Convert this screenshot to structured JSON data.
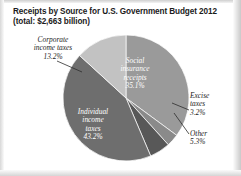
{
  "figure": {
    "title_line1": "Receipts by Source for U.S. Government Budget 2012",
    "title_line2": "(total: $2,663 billion)"
  },
  "chart_data": {
    "type": "pie",
    "title": "Receipts by Source for U.S. Government Budget 2012 (total: $2,663 billion)",
    "total_label": "(total: $2,663 billion)",
    "total_value": 2663,
    "total_units": "billion dollars",
    "value_units": "percent",
    "categories": [
      "Individual income taxes",
      "Social insurance receipts",
      "Corporate income taxes",
      "Other",
      "Excise taxes"
    ],
    "values": [
      43.2,
      35.1,
      13.2,
      5.3,
      3.2
    ],
    "slices": [
      {
        "label": "Individual income taxes",
        "label_line1": "Individual",
        "label_line2": "income",
        "label_line3": "taxes",
        "percent": "43.2%",
        "value": 43.2,
        "color": "#6e6e6e",
        "label_placement": "inside"
      },
      {
        "label": "Social insurance receipts",
        "label_line1": "Social",
        "label_line2": "insurance",
        "label_line3": "receipts",
        "percent": "35.1%",
        "value": 35.1,
        "color": "#9a9a9a",
        "label_placement": "inside"
      },
      {
        "label": "Corporate income taxes",
        "label_line1": "Corporate",
        "label_line2": "income taxes",
        "label_line3": "",
        "percent": "13.2%",
        "value": 13.2,
        "color": "#c2c2c2",
        "label_placement": "outside"
      },
      {
        "label": "Other",
        "label_line1": "Other",
        "label_line2": "",
        "label_line3": "",
        "percent": "5.3%",
        "value": 5.3,
        "color": "#585858",
        "label_placement": "outside"
      },
      {
        "label": "Excise taxes",
        "label_line1": "Excise",
        "label_line2": "taxes",
        "label_line3": "",
        "percent": "3.2%",
        "value": 3.2,
        "color": "#8a8a8a",
        "label_placement": "outside"
      }
    ],
    "legend": "none",
    "grid": false,
    "start_angle_deg": 0,
    "direction": "clockwise",
    "xlabel": "",
    "ylabel": ""
  }
}
